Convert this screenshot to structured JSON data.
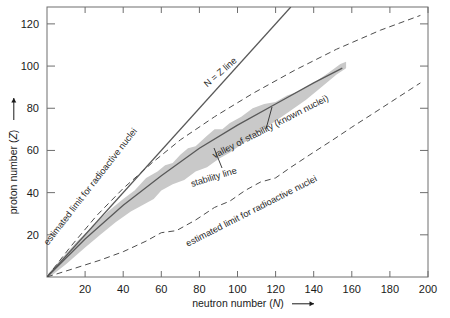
{
  "chart_data": {
    "type": "line",
    "title": "",
    "xlabel": "neutron number (N)",
    "ylabel": "proton number (Z)",
    "xlim": [
      0,
      200
    ],
    "ylim": [
      0,
      128
    ],
    "xticks": [
      20,
      40,
      60,
      80,
      100,
      120,
      140,
      160,
      180,
      200
    ],
    "yticks": [
      20,
      40,
      60,
      80,
      100,
      120
    ],
    "grid": false,
    "legend": "none",
    "annotations": [
      {
        "name": "n-equals-z-line",
        "text": "N = Z line",
        "x": 92,
        "y": 96,
        "rotation": -41
      },
      {
        "name": "valley-of-stability",
        "text": "valley of stability (known nuclei)",
        "x": 118,
        "y": 70,
        "rotation": -27
      },
      {
        "name": "stability-line",
        "text": "stability line",
        "x": 88,
        "y": 46,
        "rotation": -17
      },
      {
        "name": "limit-upper",
        "text": "estimated limit for radioactive nuclei",
        "x": 24,
        "y": 42,
        "rotation": -52
      },
      {
        "name": "limit-lower",
        "text": "estimated limit for radioactive nuclei",
        "x": 108,
        "y": 30,
        "rotation": -27
      }
    ],
    "series": [
      {
        "name": "N = Z line",
        "style": "solid",
        "color": "#595959",
        "points": [
          [
            0,
            0
          ],
          [
            128,
            128
          ]
        ]
      },
      {
        "name": "stability line",
        "style": "solid",
        "color": "#595959",
        "points": [
          [
            0,
            0
          ],
          [
            20,
            18
          ],
          [
            40,
            34
          ],
          [
            60,
            48
          ],
          [
            80,
            61
          ],
          [
            100,
            72
          ],
          [
            120,
            82
          ],
          [
            140,
            92
          ],
          [
            155,
            99
          ]
        ]
      },
      {
        "name": "estimated limit for radioactive nuclei (proton drip upper)",
        "style": "dashed",
        "color": "#4d4d4d",
        "points": [
          [
            0,
            0
          ],
          [
            12,
            14
          ],
          [
            26,
            29
          ],
          [
            40,
            42
          ],
          [
            55,
            54
          ],
          [
            70,
            65
          ],
          [
            88,
            76
          ],
          [
            108,
            87
          ],
          [
            130,
            98
          ],
          [
            152,
            108
          ],
          [
            175,
            117
          ],
          [
            196,
            124
          ]
        ]
      },
      {
        "name": "estimated limit for radioactive nuclei (neutron drip lower)",
        "style": "dashed",
        "color": "#4d4d4d",
        "points": [
          [
            0,
            0
          ],
          [
            14,
            4
          ],
          [
            28,
            8
          ],
          [
            40,
            12
          ],
          [
            52,
            17
          ],
          [
            60,
            21
          ],
          [
            68,
            22
          ],
          [
            78,
            27
          ],
          [
            88,
            33
          ],
          [
            96,
            36
          ],
          [
            104,
            41
          ],
          [
            112,
            45
          ],
          [
            120,
            47
          ],
          [
            128,
            52
          ],
          [
            138,
            58
          ],
          [
            150,
            65
          ],
          [
            160,
            71
          ],
          [
            172,
            78
          ],
          [
            184,
            85
          ],
          [
            196,
            92
          ]
        ]
      }
    ],
    "band": {
      "name": "valley of stability (known nuclei)",
      "color": "#c9c9c9",
      "upper": [
        [
          0,
          1
        ],
        [
          8,
          9
        ],
        [
          16,
          17
        ],
        [
          24,
          24
        ],
        [
          32,
          31
        ],
        [
          40,
          37
        ],
        [
          46,
          41
        ],
        [
          52,
          47
        ],
        [
          58,
          50
        ],
        [
          62,
          53
        ],
        [
          66,
          54
        ],
        [
          70,
          58
        ],
        [
          74,
          61
        ],
        [
          78,
          62
        ],
        [
          84,
          67
        ],
        [
          88,
          70
        ],
        [
          92,
          70
        ],
        [
          96,
          73
        ],
        [
          102,
          76
        ],
        [
          108,
          80
        ],
        [
          114,
          82
        ],
        [
          120,
          83
        ],
        [
          126,
          86
        ],
        [
          132,
          88
        ],
        [
          140,
          92
        ],
        [
          148,
          97
        ],
        [
          154,
          101
        ],
        [
          157,
          102
        ]
      ],
      "lower": [
        [
          0,
          -1
        ],
        [
          10,
          6
        ],
        [
          20,
          14
        ],
        [
          28,
          20
        ],
        [
          36,
          26
        ],
        [
          44,
          31
        ],
        [
          50,
          34
        ],
        [
          56,
          37
        ],
        [
          60,
          41
        ],
        [
          66,
          44
        ],
        [
          72,
          46
        ],
        [
          78,
          50
        ],
        [
          84,
          52
        ],
        [
          90,
          56
        ],
        [
          96,
          59
        ],
        [
          104,
          64
        ],
        [
          112,
          69
        ],
        [
          120,
          74
        ],
        [
          128,
          79
        ],
        [
          136,
          84
        ],
        [
          144,
          90
        ],
        [
          152,
          96
        ],
        [
          157,
          99
        ]
      ]
    }
  },
  "axes": {
    "y_title_text": "proton number (",
    "y_title_symbol": "Z",
    "y_title_tail": ")",
    "x_title_text": "neutron number (",
    "x_title_symbol": "N",
    "x_title_tail": ")",
    "arrow": "→"
  }
}
